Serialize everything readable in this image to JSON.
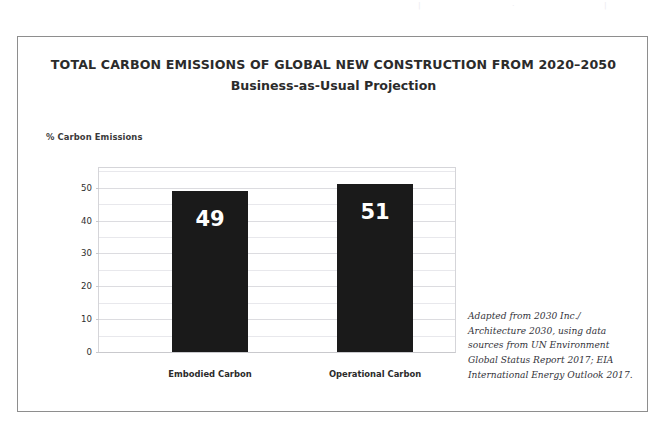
{
  "page_bleed": {
    "fragments": [
      "|",
      "·",
      "|"
    ]
  },
  "figure": {
    "title": "TOTAL CARBON EMISSIONS OF GLOBAL NEW CONSTRUCTION FROM 2020–2050",
    "subtitle": "Business-as-Usual Projection",
    "source_note": "Adapted from 2030 Inc./ Architecture 2030, using data sources from UN Environment Global Status Report 2017; EIA International Energy Outlook 2017.",
    "border_color": "#8e8e8e"
  },
  "chart_data": {
    "type": "bar",
    "title": "TOTAL CARBON EMISSIONS OF GLOBAL NEW CONSTRUCTION FROM 2020–2050",
    "subtitle": "Business-as-Usual Projection",
    "categories": [
      "Embodied Carbon",
      "Operational Carbon"
    ],
    "values": [
      49,
      51
    ],
    "value_labels": [
      "49",
      "51"
    ],
    "xlabel": "",
    "ylabel": "% Carbon Emissions",
    "ylim": [
      0,
      56
    ],
    "yticks": [
      0,
      10,
      20,
      30,
      40,
      50
    ],
    "ytick_labels": [
      "0",
      "10",
      "20",
      "30",
      "40",
      "50"
    ],
    "minor_yticks": [
      5,
      15,
      25,
      35,
      45,
      55
    ],
    "grid": true,
    "grid_axis": "y",
    "legend": false,
    "bar_color": "#1a1a1a",
    "value_label_color": "#ffffff",
    "gridline_color": "#e8e8ec",
    "units": "percent"
  }
}
